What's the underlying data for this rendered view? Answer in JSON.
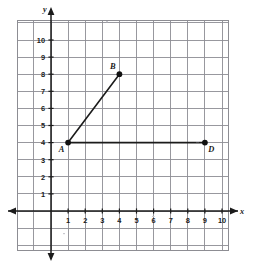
{
  "figure": {
    "background_color": "#ffffff",
    "grid_color": "#8d8d93",
    "axis_color": "#1b1b1b",
    "point_color": "#111111"
  },
  "axes": {
    "x_axis_name": "x",
    "y_axis_name": "y",
    "x_ticks": [
      1,
      2,
      3,
      4,
      5,
      6,
      7,
      8,
      9,
      10
    ],
    "y_ticks": [
      1,
      2,
      3,
      4,
      5,
      6,
      7,
      8,
      9,
      10
    ],
    "x_arrow_directions": [
      "left",
      "right"
    ],
    "y_arrow_directions": [
      "up",
      "down"
    ],
    "grid_visible": true
  },
  "chart_data": {
    "type": "scatter",
    "title": "",
    "xlabel": "x",
    "ylabel": "y",
    "xlim": [
      -2,
      11
    ],
    "ylim": [
      -2,
      12
    ],
    "grid": true,
    "grid_step": 1,
    "legend": "none",
    "points": [
      {
        "label": "A",
        "x": 1,
        "y": 4,
        "label_position": "below-left"
      },
      {
        "label": "B",
        "x": 4,
        "y": 8,
        "label_position": "above-left"
      },
      {
        "label": "D",
        "x": 9,
        "y": 4,
        "label_position": "below-right"
      }
    ],
    "segments": [
      {
        "from": "A",
        "to": "B",
        "x1": 1,
        "y1": 4,
        "x2": 4,
        "y2": 8
      },
      {
        "from": "A",
        "to": "D",
        "x1": 1,
        "y1": 4,
        "x2": 9,
        "y2": 4
      }
    ],
    "xtick_labels": [
      "1",
      "2",
      "3",
      "4",
      "5",
      "6",
      "7",
      "8",
      "9",
      "10"
    ],
    "ytick_labels": [
      "1",
      "2",
      "3",
      "4",
      "5",
      "6",
      "7",
      "8",
      "9",
      "10"
    ]
  }
}
